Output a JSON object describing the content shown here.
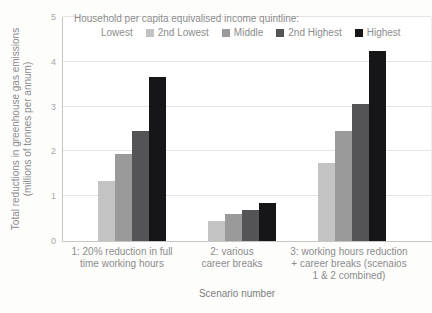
{
  "chart_data": {
    "type": "bar",
    "title": "",
    "legend_title": "Household per capita equivalised income quintline:",
    "legend_position": "top-inside",
    "categories": [
      "1: 20% reduction in full time working hours",
      "2: various career breaks",
      "3: working hours reduction + career breaks (scenaios 1 & 2 combined)"
    ],
    "category_label_lines": [
      [
        "1: 20% reduction in full",
        "time working hours"
      ],
      [
        "2: various",
        "career breaks"
      ],
      [
        "3: working hours reduction",
        "+ career breaks (scenaios",
        "1 & 2 combined)"
      ]
    ],
    "series": [
      {
        "name": "Lowest",
        "color": "#ffffff",
        "values": [
          null,
          null,
          null
        ]
      },
      {
        "name": "2nd Lowest",
        "color": "#c3c3c3",
        "values": [
          1.35,
          0.45,
          1.75
        ]
      },
      {
        "name": "Middle",
        "color": "#9a9a9a",
        "values": [
          1.95,
          0.6,
          2.45
        ]
      },
      {
        "name": "2nd Highest",
        "color": "#545456",
        "values": [
          2.45,
          0.7,
          3.05
        ]
      },
      {
        "name": "Highest",
        "color": "#161618",
        "values": [
          3.65,
          0.85,
          4.25
        ]
      }
    ],
    "xlabel": "Scenario number",
    "ylabel": "Total reductions in greenhouse gas emissions (millions of tonnes per annum)",
    "ylabel_lines": [
      "Total reductions in greenhouse gas emissions",
      "(millions of tonnes per annum)"
    ],
    "ylim": [
      0,
      5
    ],
    "yticks": [
      0,
      1,
      2,
      3,
      4,
      5
    ],
    "grid": "horizontal-major"
  }
}
